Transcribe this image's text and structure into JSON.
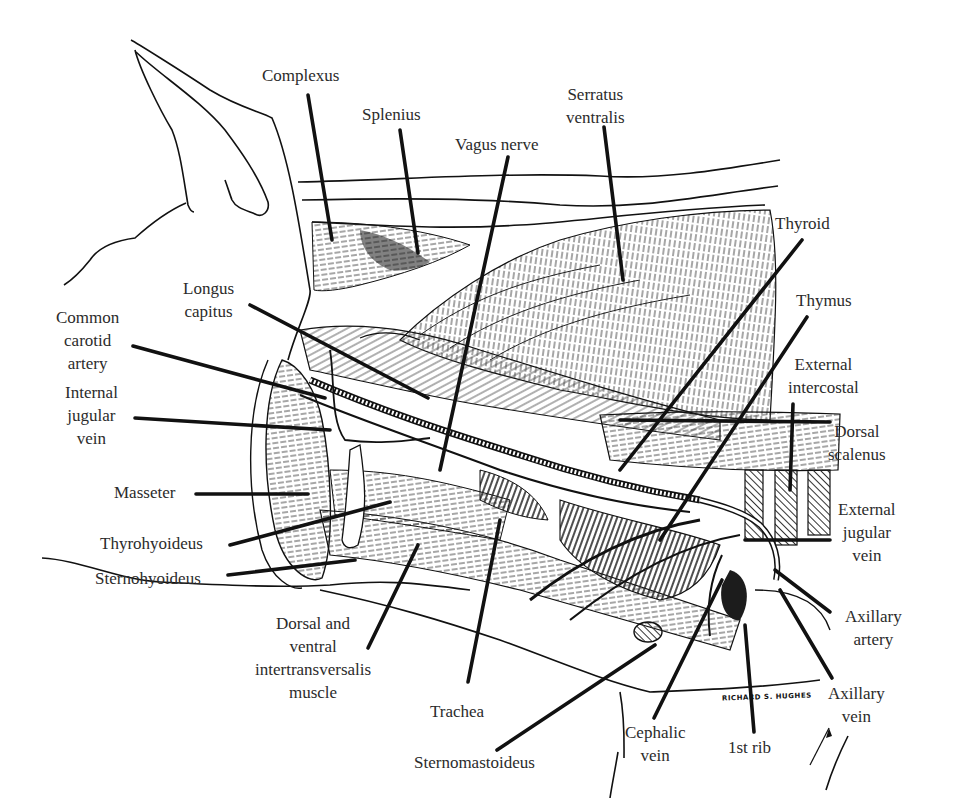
{
  "figure": {
    "colors": {
      "ink": "#111111",
      "label_text": "#2b2b2b",
      "background": "#ffffff",
      "muscle_hatch": "#3a3a3a"
    }
  },
  "labels": [
    {
      "id": "complexus",
      "text": "Complexus",
      "x": 262,
      "y": 64,
      "align": "center",
      "leader": [
        [
          308,
          95
        ],
        [
          332,
          240
        ]
      ]
    },
    {
      "id": "splenius",
      "text": "Splenius",
      "x": 362,
      "y": 103,
      "align": "center",
      "leader": [
        [
          400,
          130
        ],
        [
          418,
          253
        ]
      ]
    },
    {
      "id": "vagus-nerve",
      "text": "Vagus nerve",
      "x": 455,
      "y": 133,
      "align": "center",
      "leader": [
        [
          508,
          157
        ],
        [
          440,
          470
        ]
      ]
    },
    {
      "id": "serratus-ventralis",
      "text": "Serratus\nventralis",
      "x": 566,
      "y": 83,
      "align": "center",
      "leader": [
        [
          604,
          127
        ],
        [
          623,
          280
        ]
      ]
    },
    {
      "id": "thyroid",
      "text": "Thyroid",
      "x": 775,
      "y": 212,
      "align": "center",
      "leader": [
        [
          802,
          240
        ],
        [
          620,
          470
        ]
      ]
    },
    {
      "id": "thymus",
      "text": "Thymus",
      "x": 796,
      "y": 289,
      "align": "center",
      "leader": [
        [
          807,
          317
        ],
        [
          660,
          540
        ]
      ]
    },
    {
      "id": "longus-capitus",
      "text": "Longus\ncapitus",
      "x": 183,
      "y": 277,
      "align": "center",
      "leader": [
        [
          250,
          305
        ],
        [
          428,
          398
        ]
      ]
    },
    {
      "id": "common-carotid-artery",
      "text": "Common\ncarotid\nartery",
      "x": 56,
      "y": 306,
      "align": "center",
      "leader": [
        [
          133,
          346
        ],
        [
          325,
          398
        ]
      ]
    },
    {
      "id": "internal-jugular-vein",
      "text": "Internal\njugular\nvein",
      "x": 65,
      "y": 381,
      "align": "center",
      "leader": [
        [
          135,
          418
        ],
        [
          330,
          430
        ]
      ]
    },
    {
      "id": "external-intercostal",
      "text": "External\nintercostal",
      "x": 788,
      "y": 353,
      "align": "center",
      "leader": [
        [
          793,
          404
        ],
        [
          790,
          490
        ]
      ]
    },
    {
      "id": "dorsal-scalenus",
      "text": "Dorsal\nscalenus",
      "x": 828,
      "y": 420,
      "align": "center",
      "leader": [
        [
          830,
          422
        ],
        [
          620,
          420
        ]
      ]
    },
    {
      "id": "masseter",
      "text": "Masseter",
      "x": 114,
      "y": 481,
      "align": "right",
      "leader": [
        [
          196,
          494
        ],
        [
          308,
          494
        ]
      ]
    },
    {
      "id": "thyrohyoideus",
      "text": "Thyrohyoideus",
      "x": 100,
      "y": 532,
      "align": "right",
      "leader": [
        [
          230,
          545
        ],
        [
          390,
          502
        ]
      ]
    },
    {
      "id": "external-jugular-vein",
      "text": "External\njugular\nvein",
      "x": 838,
      "y": 498,
      "align": "center",
      "leader": [
        [
          830,
          540
        ],
        [
          745,
          540
        ]
      ]
    },
    {
      "id": "sternohyoideus",
      "text": "Sternohyoideus",
      "x": 95,
      "y": 567,
      "align": "right",
      "leader": [
        [
          228,
          575
        ],
        [
          355,
          560
        ]
      ]
    },
    {
      "id": "dorsal-ventral-intertransversalis",
      "text": "Dorsal and\nventral\nintertransversalis\nmuscle",
      "x": 255,
      "y": 612,
      "align": "center",
      "leader": [
        [
          368,
          648
        ],
        [
          418,
          545
        ]
      ]
    },
    {
      "id": "axillary-artery",
      "text": "Axillary\nartery",
      "x": 845,
      "y": 605,
      "align": "center",
      "leader": [
        [
          830,
          612
        ],
        [
          775,
          570
        ]
      ]
    },
    {
      "id": "trachea",
      "text": "Trachea",
      "x": 430,
      "y": 700,
      "align": "center",
      "leader": [
        [
          468,
          682
        ],
        [
          500,
          520
        ]
      ]
    },
    {
      "id": "axillary-vein",
      "text": "Axillary\nvein",
      "x": 828,
      "y": 682,
      "align": "center",
      "leader": [
        [
          832,
          678
        ],
        [
          780,
          590
        ]
      ]
    },
    {
      "id": "cephalic-vein",
      "text": "Cephalic\nvein",
      "x": 625,
      "y": 721,
      "align": "center",
      "leader": [
        [
          654,
          718
        ],
        [
          722,
          580
        ]
      ]
    },
    {
      "id": "first-rib",
      "text": "1st rib",
      "x": 728,
      "y": 736,
      "align": "center",
      "leader": [
        [
          754,
          732
        ],
        [
          745,
          625
        ]
      ]
    },
    {
      "id": "sternomastoideus",
      "text": "Sternomastoideus",
      "x": 414,
      "y": 751,
      "align": "center",
      "leader": [
        [
          497,
          750
        ],
        [
          655,
          645
        ]
      ]
    }
  ],
  "signature": {
    "text": "RICHARD S. HUGHES",
    "x": 722,
    "y": 697
  }
}
